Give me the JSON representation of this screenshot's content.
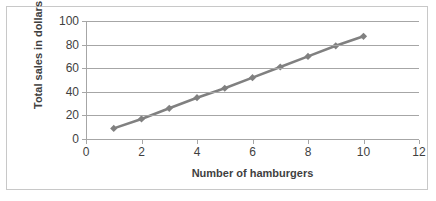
{
  "chart_data": {
    "type": "line",
    "title": "",
    "xlabel": "Number of hamburgers",
    "ylabel": "Total sales in dollars",
    "xlim": [
      0,
      12
    ],
    "ylim": [
      0,
      100
    ],
    "xticks": [
      0,
      2,
      4,
      6,
      8,
      10,
      12
    ],
    "xtick_labels": [
      "0",
      "2",
      "4",
      "6",
      "8",
      "10",
      "12"
    ],
    "yticks": [
      0,
      20,
      40,
      60,
      80,
      100
    ],
    "ytick_labels": [
      "0",
      "20",
      "40",
      "60",
      "80",
      "100"
    ],
    "grid": "horizontal",
    "legend": "none",
    "series": [
      {
        "name": "Total sales",
        "marker": "diamond",
        "color": "#808080",
        "x": [
          1,
          2,
          3,
          4,
          5,
          6,
          7,
          8,
          9,
          10
        ],
        "values": [
          9,
          17,
          26,
          35,
          43,
          52,
          61,
          70,
          79,
          87
        ]
      }
    ]
  },
  "axes": {
    "y_title": "Total sales in dollars",
    "x_title": "Number of hamburgers"
  },
  "colors": {
    "series": "#808080",
    "gridline": "#a6a6a6",
    "axis": "#a6a6a6",
    "frame": "#c8c8c8",
    "text": "#3f3f3f",
    "background": "#ffffff"
  }
}
